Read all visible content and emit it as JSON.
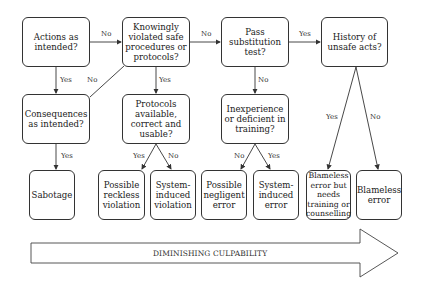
{
  "nodes": {
    "actions": "Actions as intended?",
    "knowingly": "Knowingly violated safe procedures or protocols?",
    "substitution": "Pass substitution test?",
    "history": "History of unsafe acts?",
    "consequences": "Consequences as intended?",
    "protocols": "Protocols available, correct and usable?",
    "inexperience": "Inexperience or deficient in training?",
    "sabotage": "Sabotage",
    "reckless": "Possible reckless violation",
    "sys_violation": "System-induced violation",
    "negligent": "Possible negligent error",
    "sys_error": "System-induced error",
    "blameless_needs": "Blameless error but needs training or counselling",
    "blameless": "Blameless error"
  },
  "edges": {
    "actions_knowingly": "No",
    "knowingly_substitution": "No",
    "substitution_history": "Yes",
    "actions_consequences": "Yes",
    "consequences_knowingly": "No",
    "knowingly_protocols": "Yes",
    "substitution_inexperience": "No",
    "consequences_sabotage": "Yes",
    "protocols_reckless": "Yes",
    "protocols_sysviolation": "No",
    "inexperience_negligent": "No",
    "inexperience_syserror": "Yes",
    "history_blameless_needs": "Yes",
    "history_blameless": "No"
  },
  "arrow": {
    "label": "DIMINISHING CULPABILITY"
  }
}
